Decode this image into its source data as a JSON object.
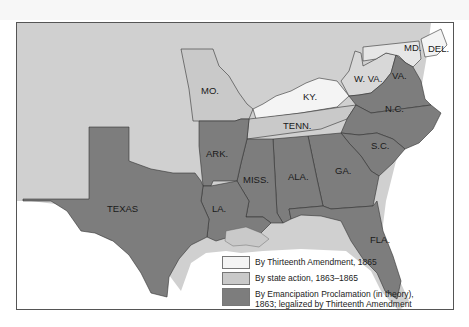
{
  "colors": {
    "thirteenth_amendment": "#f4f4f4",
    "state_action": "#c9c9c9",
    "emancipation": "#7d7d7d",
    "territory": "#d0d0d0",
    "water": "#ffffff",
    "border": "#333333"
  },
  "states": {
    "mo": "MO.",
    "ky": "KY.",
    "w_va": "W. VA.",
    "md": "MD.",
    "del": "DEL.",
    "va": "VA.",
    "tenn": "TENN.",
    "nc": "N.C.",
    "sc": "S.C.",
    "ark": "ARK.",
    "miss": "MISS.",
    "ala": "ALA.",
    "ga": "GA.",
    "la": "LA.",
    "texas": "TEXAS",
    "fla": "FLA."
  },
  "legend": {
    "items": [
      {
        "label": "By Thirteenth Amendment, 1865",
        "swatch": "thirteenth_amendment"
      },
      {
        "label": "By state action, 1863–1865",
        "swatch": "state_action"
      },
      {
        "label": "By Emancipation Proclamation (in theory), 1863; legalized by Thirteenth Amendment",
        "swatch": "emancipation"
      }
    ]
  }
}
